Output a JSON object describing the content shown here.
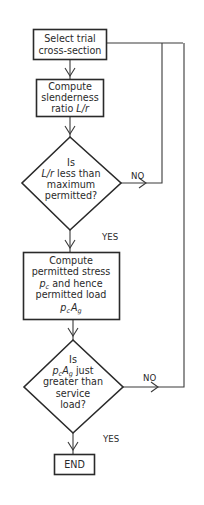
{
  "diagram": {
    "type": "flowchart",
    "nodes": {
      "select": {
        "shape": "process",
        "lines": [
          "Select trial",
          "cross-section"
        ]
      },
      "slenderness": {
        "shape": "process",
        "lines": [
          "Compute",
          "slenderness",
          "ratio "
        ],
        "math": "L/r"
      },
      "decision1": {
        "shape": "decision",
        "lines": [
          "Is",
          " less than",
          "maximum",
          "permitted?"
        ],
        "math": "L/r"
      },
      "stress": {
        "shape": "process",
        "lines": [
          "Compute",
          "permitted stress",
          " and hence",
          "permitted load"
        ],
        "math_pc": "p",
        "math_pc_sub": "c",
        "math_A": "A",
        "math_A_sub": "g"
      },
      "decision2": {
        "shape": "decision",
        "lines": [
          "Is",
          " just",
          "greater than",
          "service",
          "load?"
        ],
        "math_pc": "p",
        "math_pc_sub": "c",
        "math_A": "A",
        "math_A_sub": "g"
      },
      "end": {
        "shape": "terminal",
        "label": "END"
      }
    },
    "edges": [
      {
        "from": "select",
        "to": "slenderness",
        "label": ""
      },
      {
        "from": "slenderness",
        "to": "decision1",
        "label": ""
      },
      {
        "from": "decision1",
        "to": "stress",
        "label": "YES"
      },
      {
        "from": "decision1",
        "to": "select",
        "label": "NO"
      },
      {
        "from": "stress",
        "to": "decision2",
        "label": ""
      },
      {
        "from": "decision2",
        "to": "end",
        "label": "YES"
      },
      {
        "from": "decision2",
        "to": "select",
        "label": "NO"
      }
    ],
    "labels": {
      "yes1": "YES",
      "no1": "NO",
      "yes2": "YES",
      "no2": "NO"
    },
    "colors": {
      "stroke": "#2a2a2a",
      "background": "#ffffff"
    }
  }
}
